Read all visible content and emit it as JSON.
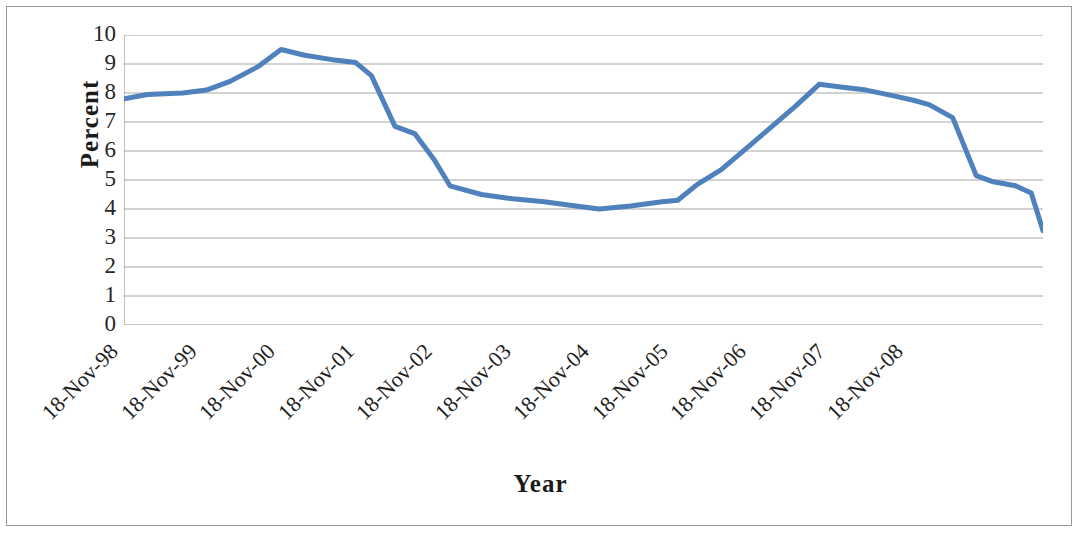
{
  "chart_data": {
    "type": "line",
    "title": "",
    "xlabel": "Year",
    "ylabel": "Percent",
    "ylim": [
      0,
      10
    ],
    "ytick_labels": [
      "10",
      "9",
      "8",
      "7",
      "6",
      "5",
      "4",
      "3",
      "2",
      "1",
      "0"
    ],
    "ytick_values": [
      10,
      9,
      8,
      7,
      6,
      5,
      4,
      3,
      2,
      1,
      0
    ],
    "grid": "horizontal",
    "legend": "none",
    "categories": [
      "18-Nov-98",
      "18-Nov-99",
      "18-Nov-00",
      "18-Nov-01",
      "18-Nov-02",
      "18-Nov-03",
      "18-Nov-04",
      "18-Nov-05",
      "18-Nov-06",
      "18-Nov-07",
      "18-Nov-08"
    ],
    "series": [
      {
        "name": "Percent",
        "color": "#4f81bd",
        "x": [
          0.0,
          0.25,
          0.5,
          0.75,
          1.0,
          1.25,
          1.5,
          1.75,
          2.0,
          2.25,
          2.5,
          2.75,
          3.0,
          3.25,
          3.5,
          3.75,
          4.0,
          4.25,
          4.5,
          4.75,
          5.0,
          5.25,
          5.5,
          5.75,
          6.0,
          6.25,
          6.5,
          6.75,
          7.0,
          7.25,
          7.5,
          7.75,
          8.0,
          8.25,
          8.5,
          8.75,
          9.0,
          9.25,
          9.5,
          9.75,
          10.0
        ],
        "values": [
          7.8,
          7.9,
          7.95,
          8.0,
          8.05,
          8.35,
          8.75,
          9.5,
          9.35,
          9.25,
          9.05,
          8.95,
          8.1,
          6.85,
          6.6,
          5.7,
          4.8,
          4.55,
          4.4,
          4.3,
          4.25,
          4.2,
          4.1,
          4.0,
          4.05,
          4.15,
          4.25,
          4.3,
          4.85,
          5.35,
          6.15,
          6.8,
          7.55,
          8.3,
          8.2,
          8.05,
          7.85,
          7.7,
          7.15,
          5.15,
          4.95
        ],
        "tail_x": [
          10.0,
          10.15
        ],
        "tail_values": [
          4.95,
          4.6
        ]
      }
    ],
    "line_points": [
      [
        0.0,
        7.8
      ],
      [
        0.3,
        7.95
      ],
      [
        0.75,
        8.0
      ],
      [
        1.05,
        8.1
      ],
      [
        1.35,
        8.4
      ],
      [
        1.7,
        8.9
      ],
      [
        2.0,
        9.5
      ],
      [
        2.3,
        9.3
      ],
      [
        2.65,
        9.15
      ],
      [
        2.95,
        9.05
      ],
      [
        3.15,
        8.6
      ],
      [
        3.45,
        6.85
      ],
      [
        3.7,
        6.6
      ],
      [
        3.95,
        5.7
      ],
      [
        4.15,
        4.8
      ],
      [
        4.55,
        4.5
      ],
      [
        4.95,
        4.35
      ],
      [
        5.35,
        4.25
      ],
      [
        5.75,
        4.1
      ],
      [
        6.05,
        4.0
      ],
      [
        6.45,
        4.1
      ],
      [
        6.85,
        4.25
      ],
      [
        7.05,
        4.3
      ],
      [
        7.3,
        4.85
      ],
      [
        7.6,
        5.35
      ],
      [
        7.95,
        6.15
      ],
      [
        8.25,
        6.85
      ],
      [
        8.55,
        7.55
      ],
      [
        8.85,
        8.3
      ],
      [
        9.15,
        8.2
      ],
      [
        9.45,
        8.1
      ],
      [
        9.8,
        7.9
      ],
      [
        10.05,
        7.75
      ],
      [
        10.25,
        7.6
      ],
      [
        10.55,
        7.15
      ],
      [
        10.85,
        5.15
      ],
      [
        11.05,
        4.95
      ],
      [
        11.35,
        4.8
      ],
      [
        11.55,
        4.55
      ],
      [
        11.7,
        3.25
      ]
    ]
  },
  "axes": {
    "y_title": "Percent",
    "x_title": "Year"
  }
}
